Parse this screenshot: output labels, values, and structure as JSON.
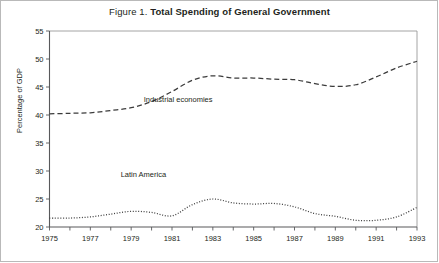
{
  "figure": {
    "prefix": "Figure 1.",
    "title": "Total Spending of General Government"
  },
  "chart_data": {
    "type": "line",
    "title": "Figure 1. Total Spending of General Government",
    "xlabel": "",
    "ylabel": "Percentage of GDP",
    "ylim": [
      20,
      55
    ],
    "ytick_labels": [
      "20",
      "25",
      "30",
      "35",
      "40",
      "45",
      "50",
      "55"
    ],
    "yticks": [
      20,
      25,
      30,
      35,
      40,
      45,
      50,
      55
    ],
    "xlim": [
      1975,
      1993
    ],
    "xticks": [
      1975,
      1976,
      1977,
      1978,
      1979,
      1980,
      1981,
      1982,
      1983,
      1984,
      1985,
      1986,
      1987,
      1988,
      1989,
      1990,
      1991,
      1992,
      1993
    ],
    "xtick_labels": [
      "1975",
      "",
      "1977",
      "",
      "1979",
      "",
      "1981",
      "",
      "1983",
      "",
      "1985",
      "",
      "1987",
      "",
      "1989",
      "",
      "1991",
      "",
      "1993"
    ],
    "grid": false,
    "legend_position": "inline-annotations",
    "x": [
      1975,
      1976,
      1977,
      1978,
      1979,
      1980,
      1981,
      1982,
      1983,
      1984,
      1985,
      1986,
      1987,
      1988,
      1989,
      1990,
      1991,
      1992,
      1993
    ],
    "series": [
      {
        "name": "Industrial economies",
        "style": "dashed",
        "color": "#3b3b3b",
        "values": [
          40.2,
          40.3,
          40.4,
          40.8,
          41.3,
          42.4,
          44.2,
          46.2,
          47.0,
          46.6,
          46.6,
          46.4,
          46.3,
          45.6,
          45.1,
          45.4,
          46.8,
          48.4,
          49.6
        ]
      },
      {
        "name": "Latin America",
        "style": "dotted",
        "color": "#3b3b3b",
        "values": [
          21.6,
          21.6,
          21.8,
          22.3,
          22.8,
          22.6,
          22.0,
          24.0,
          25.0,
          24.3,
          24.1,
          24.2,
          23.6,
          22.4,
          21.9,
          21.2,
          21.2,
          21.8,
          23.5
        ]
      }
    ],
    "annotations": [
      {
        "text": "Industrial economies",
        "x": 1981.3,
        "y": 42.3
      },
      {
        "text": "Latin America",
        "x": 1979.6,
        "y": 28.9
      }
    ]
  }
}
